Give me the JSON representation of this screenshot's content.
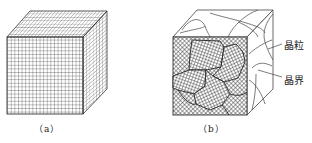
{
  "figure": {
    "panels": [
      {
        "id": "a",
        "caption": "（a）",
        "description": "single crystal cube with uniform lattice grid"
      },
      {
        "id": "b",
        "caption": "（b）",
        "description": "polycrystal cube composed of differently oriented grains"
      }
    ],
    "annotations": [
      {
        "label": "晶粒",
        "target": "grain"
      },
      {
        "label": "晶界",
        "target": "grain boundary"
      }
    ],
    "colors": {
      "line": "#333333",
      "background": "#ffffff"
    }
  }
}
